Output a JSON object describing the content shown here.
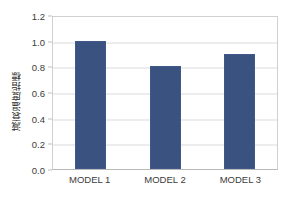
{
  "chart_data": {
    "type": "bar",
    "title": "",
    "xlabel": "",
    "ylabel": "減衰温度指標",
    "categories": [
      "MODEL 1",
      "MODEL 2",
      "MODEL 3"
    ],
    "values": [
      1.0,
      0.8,
      0.9
    ],
    "series": [
      {
        "name": "",
        "values": [
          1.0,
          0.8,
          0.9
        ]
      }
    ],
    "ylim": [
      0.0,
      1.2
    ],
    "ytick_labels": [
      "0.0",
      "0.2",
      "0.4",
      "0.6",
      "0.8",
      "1.0",
      "1.2"
    ],
    "ytick_values": [
      0.0,
      0.2,
      0.4,
      0.6,
      0.8,
      1.0,
      1.2
    ],
    "grid": "horizontal",
    "legend": "none",
    "bar_color": "#3a5280",
    "gridline_color": "#dcdcdc",
    "axis_color": "#d0d0d0",
    "background_color": "#ffffff"
  }
}
